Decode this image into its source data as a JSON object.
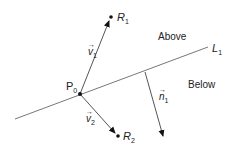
{
  "diagram": {
    "line": {
      "label": "L",
      "subscript": "1"
    },
    "point_p0": {
      "label": "P",
      "subscript": "0"
    },
    "point_r1": {
      "label": "R",
      "subscript": "1"
    },
    "point_r2": {
      "label": "R",
      "subscript": "2"
    },
    "vector_v1": {
      "label": "v",
      "subscript": "1",
      "arrow": "⃗"
    },
    "vector_v2": {
      "label": "v",
      "subscript": "2",
      "arrow": "⃗"
    },
    "vector_n1": {
      "label": "n",
      "subscript": "1",
      "arrow": "⃗"
    },
    "region_above": "Above",
    "region_below": "Below",
    "colors": {
      "line": "#777777",
      "vector": "#444444",
      "point": "#111111"
    }
  }
}
